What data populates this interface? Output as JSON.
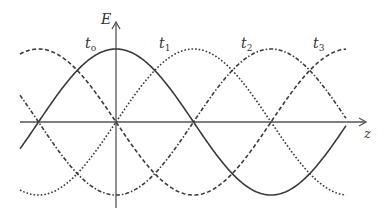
{
  "diagram": {
    "axes": {
      "vertical_label": "E",
      "horizontal_label": "z"
    },
    "curves": [
      {
        "label": "t",
        "subscript": "o",
        "style": "solid",
        "phase_shift_quarter_periods": 0
      },
      {
        "label": "t",
        "subscript": "1",
        "style": "dotted",
        "phase_shift_quarter_periods": 1
      },
      {
        "label": "t",
        "subscript": "2",
        "style": "dash-dot",
        "phase_shift_quarter_periods": 2
      },
      {
        "label": "t",
        "subscript": "3",
        "style": "dashed",
        "phase_shift_quarter_periods": 3
      }
    ],
    "colors": {
      "axis": "#555555",
      "curve": "#3a3a3a"
    }
  }
}
